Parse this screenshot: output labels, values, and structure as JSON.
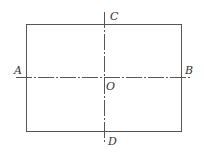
{
  "diagram": {
    "labels": {
      "A": "A",
      "B": "B",
      "C": "C",
      "D": "D",
      "O": "O"
    },
    "rectangle": {
      "x": 26,
      "y": 24,
      "width": 155,
      "height": 107
    },
    "horizontal_axis": {
      "x1": 16,
      "y": 77,
      "x2": 191,
      "from": "A",
      "to": "B",
      "style": "dash-dot"
    },
    "vertical_axis": {
      "x": 104,
      "y1": 12,
      "y2": 144,
      "from": "C",
      "to": "D",
      "style": "dash-dot"
    },
    "colors": {
      "stroke": "#555555",
      "background": "#ffffff"
    }
  }
}
